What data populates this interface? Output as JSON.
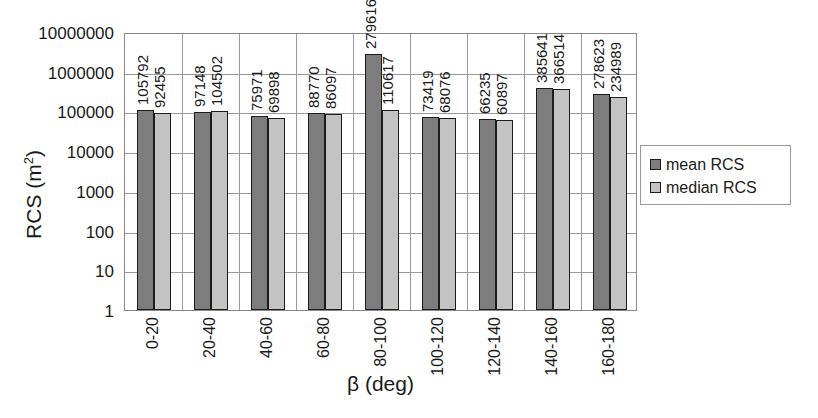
{
  "chart_data": {
    "type": "bar",
    "title": "",
    "xlabel": "β (deg)",
    "ylabel": "RCS (m²)",
    "yscale": "log",
    "ylim": [
      1,
      10000000
    ],
    "ytick_labels": [
      "10000000",
      "1000000",
      "100000",
      "10000",
      "1000",
      "100",
      "10",
      "1"
    ],
    "ytick_values": [
      10000000,
      1000000,
      100000,
      10000,
      1000,
      100,
      10,
      1
    ],
    "grid": true,
    "legend_position": "right",
    "categories": [
      "0-20",
      "20-40",
      "40-60",
      "60-80",
      "80-100",
      "100-120",
      "120-140",
      "140-160",
      "160-180"
    ],
    "series": [
      {
        "name": "mean RCS",
        "color": "#7d7d7d",
        "values": [
          105792,
          97148,
          75971,
          88770,
          2796163,
          73419,
          66235,
          385641,
          278623
        ]
      },
      {
        "name": "median RCS",
        "color": "#c3c3c3",
        "values": [
          92455,
          104502,
          69898,
          86097,
          110617,
          68076,
          60897,
          366514,
          234989
        ]
      }
    ],
    "bar_labels": [
      [
        "105792",
        "92455"
      ],
      [
        "97148",
        "104502"
      ],
      [
        "75971",
        "69898"
      ],
      [
        "88770",
        "86097"
      ],
      [
        "2796163",
        "110617"
      ],
      [
        "73419",
        "68076"
      ],
      [
        "66235",
        "60897"
      ],
      [
        "385641",
        "366514"
      ],
      [
        "278623",
        "234989"
      ]
    ]
  },
  "legend": {
    "items": [
      {
        "label": "mean RCS",
        "swatch": "mean"
      },
      {
        "label": "median RCS",
        "swatch": "median"
      }
    ]
  },
  "axis": {
    "y_title_main": "RCS (m",
    "y_title_sup": "2",
    "y_title_close": ")",
    "x_title": "β (deg)"
  }
}
